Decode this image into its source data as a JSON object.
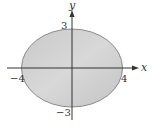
{
  "figure": {
    "type": "ellipse-plot",
    "equation_implied": "x^2/16 + y^2/9 = 1",
    "axes": {
      "x_label": "x",
      "y_label": "y"
    },
    "ticks": {
      "y_top": "3",
      "y_bottom": "−3",
      "x_left": "−4",
      "x_right": "4"
    },
    "ellipse": {
      "semi_major_x": 4,
      "semi_minor_y": 3,
      "fill_color": "#cfcfcf",
      "stroke_color": "#8a8a8a"
    },
    "axis_color": "#333333"
  }
}
